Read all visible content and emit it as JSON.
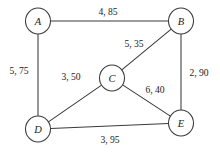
{
  "figure": {
    "name": "weighted-undirected-graph",
    "background_color": "#ffffff",
    "stroke_color": "#3a3a3a",
    "text_color": "#1c1c1c",
    "width": 220,
    "height": 152
  },
  "chart_data": {
    "type": "diagram",
    "title": "",
    "xlabel": "",
    "ylabel": "",
    "graph_type": "undirected-weighted-graph",
    "edge_label_format": "capacity, cost",
    "nodes": [
      {
        "id": "A",
        "label": "A",
        "x": 38,
        "y": 21,
        "rx": 12.5,
        "ry": 13.0
      },
      {
        "id": "B",
        "label": "B",
        "x": 181,
        "y": 21,
        "rx": 12.5,
        "ry": 13.0
      },
      {
        "id": "C",
        "label": "C",
        "x": 112,
        "y": 78,
        "rx": 12.5,
        "ry": 13.0
      },
      {
        "id": "D",
        "label": "D",
        "x": 38,
        "y": 129,
        "rx": 12.5,
        "ry": 13.0
      },
      {
        "id": "E",
        "label": "E",
        "x": 181,
        "y": 123,
        "rx": 12.5,
        "ry": 13.0
      }
    ],
    "edges": [
      {
        "id": "AB",
        "from": "A",
        "to": "B",
        "label": "4, 85",
        "label_x": 108,
        "label_y": 11
      },
      {
        "id": "AD",
        "from": "A",
        "to": "D",
        "label": "5, 75",
        "label_x": 19,
        "label_y": 70
      },
      {
        "id": "BC",
        "from": "B",
        "to": "C",
        "label": "5, 35",
        "label_x": 134,
        "label_y": 43
      },
      {
        "id": "BE",
        "from": "B",
        "to": "E",
        "label": "2, 90",
        "label_x": 199,
        "label_y": 72
      },
      {
        "id": "CD",
        "from": "C",
        "to": "D",
        "label": "3, 50",
        "label_x": 71,
        "label_y": 76
      },
      {
        "id": "CE",
        "from": "C",
        "to": "E",
        "label": "6, 40",
        "label_x": 155,
        "label_y": 89
      },
      {
        "id": "DE",
        "from": "D",
        "to": "E",
        "label": "3, 95",
        "label_x": 110,
        "label_y": 139
      }
    ]
  }
}
